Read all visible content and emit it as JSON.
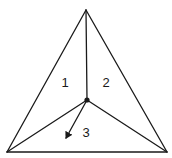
{
  "diagram": {
    "type": "triangle-partition",
    "vertices": {
      "top": [
        86,
        10
      ],
      "bottom_left": [
        7,
        152
      ],
      "bottom_right": [
        167,
        152
      ],
      "center": [
        87,
        100
      ]
    },
    "regions": [
      {
        "id": "region-1",
        "label": "1",
        "pos": [
          65,
          87
        ]
      },
      {
        "id": "region-2",
        "label": "2",
        "pos": [
          106,
          87
        ]
      },
      {
        "id": "region-3",
        "label": "3",
        "pos": [
          86,
          137
        ]
      }
    ],
    "arrow": {
      "from": [
        87,
        100
      ],
      "to": [
        65,
        140
      ]
    },
    "colors": {
      "stroke": "#1a1a1a",
      "background": "#ffffff"
    }
  }
}
